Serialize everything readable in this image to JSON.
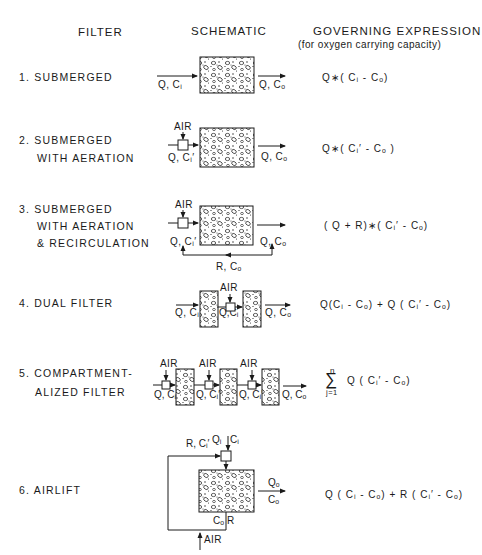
{
  "headers": {
    "filter": "FILTER",
    "schematic": "SCHEMATIC",
    "expression": "GOVERNING EXPRESSION",
    "expression_sub": "(for oxygen carrying capacity)"
  },
  "rows": [
    {
      "name_lines": [
        "1. SUBMERGED"
      ],
      "schematic": {
        "in": "Q, Cᵢ",
        "out": "Q, Cₒ"
      },
      "expression": "Q∗( Cᵢ -  Cₒ)"
    },
    {
      "name_lines": [
        "2. SUBMERGED",
        "WITH AERATION"
      ],
      "schematic": {
        "air": "AIR",
        "in": "Q, Cᵢ′",
        "out": "Q, Cₒ"
      },
      "expression": "Q∗( Cᵢ′ - Cₒ )"
    },
    {
      "name_lines": [
        "3. SUBMERGED",
        "WITH AERATION",
        "& RECIRCULATION"
      ],
      "schematic": {
        "air": "AIR",
        "in": "Q, Cᵢ′",
        "out": "Q, Cₒ",
        "recycle": "R, Cₒ"
      },
      "expression": "( Q + R)∗( Cᵢ′ - Cₒ)"
    },
    {
      "name_lines": [
        "4. DUAL FILTER"
      ],
      "schematic": {
        "air": "AIR",
        "in": "Q, Cᵢ",
        "mid": "Q,Cᵢ",
        "out": "Q, Cₒ"
      },
      "expression": "Q(Cᵢ - Cₒ) + Q ( Cᵢ′ - Cₒ)"
    },
    {
      "name_lines": [
        "5. COMPARTMENT-",
        "ALIZED FILTER"
      ],
      "schematic": {
        "air": "AIR",
        "stage_label": "Q, Cᵢ′",
        "out": "Q, Cₒ"
      },
      "expression": {
        "sum_top": "n",
        "sum_bottom": "j=1",
        "body": "Q  ( Cᵢ′ - Cₒ)"
      }
    },
    {
      "name_lines": [
        "6. AIRLIFT"
      ],
      "schematic": {
        "recycle": "R, Cᵢ′",
        "in_q": "Qᵢ",
        "in_c": "Cᵢ",
        "out_q": "Qₒ",
        "out_c": "Cₒ",
        "bottom_c": "Cₒ",
        "bottom_r": "R",
        "air": "AIR"
      },
      "expression": "Q ( Cᵢ - Cₒ) + R ( Cᵢ′ - Cₒ)"
    }
  ],
  "colors": {
    "ink": "#1a1a1a",
    "paper": "#ffffff"
  }
}
